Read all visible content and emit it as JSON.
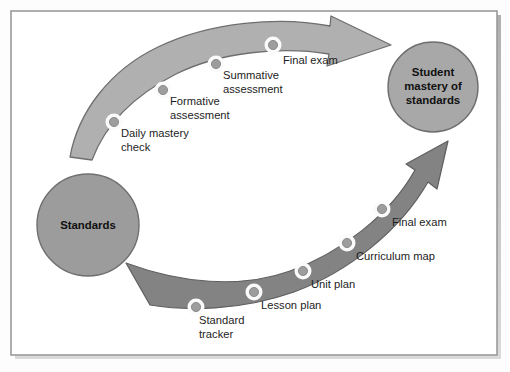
{
  "figure": {
    "background_color": "#fdfdfd",
    "frame": {
      "border_color": "#9a9a9a",
      "shadow_color": "#5a5a5a",
      "x": 11,
      "y": 11,
      "width": 486,
      "height": 344
    }
  },
  "nodes": {
    "start": {
      "label_line1": "Standards",
      "cx": 88,
      "cy": 225,
      "r": 51,
      "fill": "#9c9c9c",
      "stroke": "#6f6f6f"
    },
    "end": {
      "label_line1": "Student",
      "label_line2": "mastery of",
      "label_line3": "standards",
      "cx": 433,
      "cy": 87,
      "r": 45,
      "fill": "#a8a8a8",
      "stroke": "#6f6f6f"
    }
  },
  "arrows": {
    "upper": {
      "name": "assessment-pathway",
      "fill": "#b0b0b0",
      "stroke": "#6e6e6e",
      "milestones": [
        {
          "label_line1": "Daily mastery",
          "label_line2": "check",
          "cx": 114,
          "cy": 122,
          "label_x": 121,
          "label_y": 137
        },
        {
          "label_line1": "Formative",
          "label_line2": "assessment",
          "cx": 163,
          "cy": 90,
          "label_x": 170,
          "label_y": 105
        },
        {
          "label_line1": "Summative",
          "label_line2": "assessment",
          "cx": 216,
          "cy": 64,
          "label_x": 223,
          "label_y": 79
        },
        {
          "label_line1": "Final exam",
          "label_line2": "",
          "cx": 273,
          "cy": 45,
          "label_x": 283,
          "label_y": 64
        }
      ]
    },
    "lower": {
      "name": "planning-pathway",
      "fill": "#838383",
      "stroke": "#5f5f5f",
      "milestones": [
        {
          "label_line1": "Standard",
          "label_line2": "tracker",
          "cx": 196,
          "cy": 307,
          "label_x": 199,
          "label_y": 323
        },
        {
          "label_line1": "Lesson plan",
          "label_line2": "",
          "cx": 254,
          "cy": 292,
          "label_x": 261,
          "label_y": 309
        },
        {
          "label_line1": "Unit plan",
          "label_line2": "",
          "cx": 303,
          "cy": 271,
          "label_x": 311,
          "label_y": 288
        },
        {
          "label_line1": "Curriculum map",
          "label_line2": "",
          "cx": 347,
          "cy": 243,
          "label_x": 356,
          "label_y": 260
        },
        {
          "label_line1": "Final exam",
          "label_line2": "",
          "cx": 382,
          "cy": 209,
          "label_x": 392,
          "label_y": 226
        }
      ]
    }
  },
  "milestone_dot": {
    "halo_fill": "#fbfbfb",
    "halo_r": 8.5,
    "dot_fill": "#9d9d9d",
    "dot_stroke": "#7c7c7c",
    "dot_r": 4.6
  }
}
